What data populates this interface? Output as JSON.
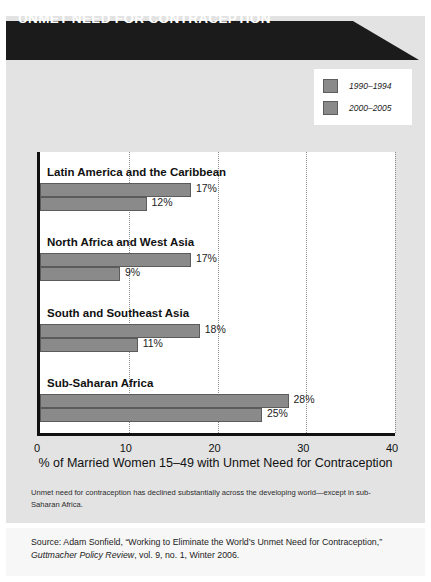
{
  "title": "UNMET NEED FOR CONTRACEPTION",
  "legend": {
    "items": [
      {
        "label": "1990–1994",
        "color": "#8a8a8a"
      },
      {
        "label": "2000–2005",
        "color": "#8a8a8a"
      }
    ]
  },
  "axis_title": "% of Married Women 15–49 with Unmet Need for Contraception",
  "note": "Unmet need for contraception has declined substantially across the developing world—except in sub-Saharan Africa.",
  "source": {
    "prefix": "Source: Adam Sonfield, “Working to Eliminate the World’s Unmet Need for Contraception,” ",
    "journal": "Guttmacher Policy Review",
    "suffix": ", vol. 9, no. 1, Winter 2006."
  },
  "chart_data": {
    "type": "bar",
    "orientation": "horizontal",
    "title": "UNMET NEED FOR CONTRACEPTION",
    "xlabel": "% of Married Women 15–49 with Unmet Need for Contraception",
    "ylabel": "",
    "xlim": [
      0,
      40
    ],
    "xticks": [
      0,
      10,
      20,
      30,
      40
    ],
    "xtick_labels": [
      "0",
      "10",
      "20",
      "30",
      "40"
    ],
    "grid": "vertical-dotted",
    "legend_position": "top-right",
    "categories": [
      "Latin America and the Caribbean",
      "North Africa and West Asia",
      "South and Southeast Asia",
      "Sub-Saharan Africa"
    ],
    "series": [
      {
        "name": "1990–1994",
        "color": "#8a8a8a",
        "values": [
          17,
          17,
          18,
          28
        ],
        "value_labels": [
          "17%",
          "17%",
          "18%",
          "28%"
        ]
      },
      {
        "name": "2000–2005",
        "color": "#8a8a8a",
        "values": [
          12,
          9,
          11,
          25
        ],
        "value_labels": [
          "12%",
          "9%",
          "11%",
          "25%"
        ]
      }
    ]
  }
}
